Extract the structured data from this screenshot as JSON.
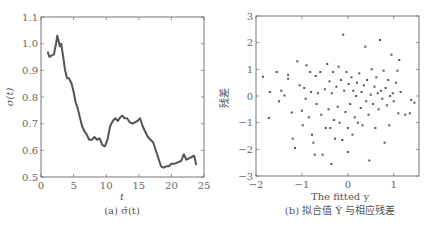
{
  "chart_data": [
    {
      "type": "line",
      "title": "",
      "caption": "(a) σ̂(t)",
      "xlabel": "t",
      "ylabel": "σ(t)",
      "xlim": [
        0,
        25
      ],
      "ylim": [
        0.5,
        1.1
      ],
      "xticks": [
        0,
        5,
        10,
        15,
        20,
        25
      ],
      "yticks": [
        0.5,
        0.6,
        0.7,
        0.8,
        0.9,
        1.0,
        1.1
      ],
      "xtick_labels": [
        "0",
        "5",
        "10",
        "15",
        "20",
        "25"
      ],
      "ytick_labels": [
        "0.5",
        "0.6",
        "0.7",
        "0.8",
        "0.9",
        "1.0",
        "1.1"
      ],
      "grid": false,
      "series": [
        {
          "name": "sigma_hat",
          "color": "#555555",
          "x": [
            1.0,
            1.3,
            1.6,
            2.0,
            2.3,
            2.5,
            2.7,
            2.9,
            3.1,
            3.4,
            3.7,
            4.0,
            4.3,
            4.7,
            5.0,
            5.3,
            5.6,
            6.0,
            6.3,
            6.7,
            7.0,
            7.4,
            7.8,
            8.2,
            8.6,
            9.0,
            9.4,
            9.8,
            10.2,
            10.6,
            11.0,
            11.4,
            11.8,
            12.2,
            12.5,
            12.8,
            13.2,
            13.6,
            14.0,
            14.4,
            14.8,
            15.2,
            15.6,
            16.0,
            16.4,
            16.8,
            17.2,
            17.6,
            18.0,
            18.4,
            18.8,
            19.2,
            19.6,
            20.0,
            20.5,
            21.0,
            21.5,
            21.9,
            22.3,
            22.7,
            23.1,
            23.5,
            23.8
          ],
          "y": [
            0.97,
            0.95,
            0.955,
            0.96,
            1.0,
            1.03,
            1.01,
            0.99,
            1.0,
            0.95,
            0.9,
            0.87,
            0.87,
            0.85,
            0.82,
            0.78,
            0.76,
            0.72,
            0.69,
            0.67,
            0.66,
            0.64,
            0.64,
            0.65,
            0.64,
            0.645,
            0.62,
            0.615,
            0.64,
            0.69,
            0.71,
            0.72,
            0.71,
            0.725,
            0.73,
            0.72,
            0.72,
            0.705,
            0.7,
            0.705,
            0.71,
            0.72,
            0.69,
            0.67,
            0.65,
            0.64,
            0.63,
            0.6,
            0.57,
            0.54,
            0.535,
            0.54,
            0.54,
            0.55,
            0.55,
            0.555,
            0.56,
            0.585,
            0.565,
            0.57,
            0.575,
            0.58,
            0.545
          ]
        }
      ]
    },
    {
      "type": "scatter",
      "title": "",
      "caption": "(b) 拟合值 Ŷ 与相应残差",
      "xlabel": "The fitted y",
      "ylabel": "残差",
      "xlim": [
        -2,
        1.55
      ],
      "ylim": [
        -3,
        3
      ],
      "xticks": [
        -2,
        -1,
        0,
        1
      ],
      "yticks": [
        -3,
        -2,
        -1,
        0,
        1,
        2,
        3
      ],
      "xtick_labels": [
        "−2",
        "−1",
        "0",
        "1"
      ],
      "ytick_labels": [
        "−3",
        "−2",
        "−1",
        "0",
        "1",
        "2",
        "3"
      ],
      "grid": false,
      "series": [
        {
          "name": "residuals",
          "color": "#555555",
          "points": [
            [
              -1.85,
              0.72
            ],
            [
              -1.7,
              0.15
            ],
            [
              -1.72,
              -0.82
            ],
            [
              -1.55,
              0.9
            ],
            [
              -1.45,
              0.2
            ],
            [
              -1.5,
              -0.2
            ],
            [
              -1.38,
              0.02
            ],
            [
              -1.3,
              0.8
            ],
            [
              -1.3,
              0.65
            ],
            [
              -1.22,
              -0.62
            ],
            [
              -1.2,
              -1.6
            ],
            [
              -1.15,
              -1.95
            ],
            [
              -1.1,
              1.3
            ],
            [
              -1.05,
              0.4
            ],
            [
              -1.0,
              -0.55
            ],
            [
              -0.98,
              -1.1
            ],
            [
              -0.95,
              0.3
            ],
            [
              -0.92,
              -0.1
            ],
            [
              -0.9,
              1.15
            ],
            [
              -0.85,
              -0.8
            ],
            [
              -0.82,
              0.9
            ],
            [
              -0.8,
              0.15
            ],
            [
              -0.78,
              -1.45
            ],
            [
              -0.75,
              -1.75
            ],
            [
              -0.72,
              -2.2
            ],
            [
              -0.7,
              0.75
            ],
            [
              -0.68,
              -0.3
            ],
            [
              -0.65,
              0.1
            ],
            [
              -0.6,
              0.9
            ],
            [
              -0.58,
              -0.7
            ],
            [
              -0.55,
              -2.2
            ],
            [
              -0.5,
              0.25
            ],
            [
              -0.48,
              -1.2
            ],
            [
              -0.45,
              1.2
            ],
            [
              -0.42,
              -0.5
            ],
            [
              -0.4,
              0.55
            ],
            [
              -0.38,
              -1.2
            ],
            [
              -0.36,
              -2.55
            ],
            [
              -0.35,
              0.1
            ],
            [
              -0.32,
              0.9
            ],
            [
              -0.3,
              -0.9
            ],
            [
              -0.28,
              -1.6
            ],
            [
              -0.25,
              0.35
            ],
            [
              -0.22,
              -0.4
            ],
            [
              -0.2,
              1.1
            ],
            [
              -0.18,
              -1.0
            ],
            [
              -0.15,
              0.6
            ],
            [
              -0.12,
              -1.65
            ],
            [
              -0.1,
              2.3
            ],
            [
              -0.08,
              0.2
            ],
            [
              -0.05,
              -0.6
            ],
            [
              -0.03,
              0.9
            ],
            [
              0.0,
              -1.2
            ],
            [
              0.0,
              -2.1
            ],
            [
              0.02,
              0.45
            ],
            [
              0.05,
              -0.3
            ],
            [
              0.08,
              0.7
            ],
            [
              0.1,
              -1.45
            ],
            [
              0.12,
              0.2
            ],
            [
              0.15,
              -0.8
            ],
            [
              0.18,
              0.0
            ],
            [
              0.2,
              0.5
            ],
            [
              0.22,
              -1.0
            ],
            [
              0.25,
              0.85
            ],
            [
              0.28,
              -0.45
            ],
            [
              0.3,
              0.15
            ],
            [
              0.32,
              -1.1
            ],
            [
              0.35,
              0.4
            ],
            [
              0.38,
              1.85
            ],
            [
              0.4,
              -0.2
            ],
            [
              0.42,
              0.6
            ],
            [
              0.45,
              -0.7
            ],
            [
              0.47,
              -2.42
            ],
            [
              0.5,
              0.05
            ],
            [
              0.52,
              1.0
            ],
            [
              0.55,
              -0.3
            ],
            [
              0.58,
              0.35
            ],
            [
              0.6,
              -1.2
            ],
            [
              0.62,
              0.7
            ],
            [
              0.65,
              0.1
            ],
            [
              0.67,
              -0.5
            ],
            [
              0.7,
              2.1
            ],
            [
              0.72,
              0.2
            ],
            [
              0.75,
              -0.1
            ],
            [
              0.78,
              0.95
            ],
            [
              0.8,
              -1.75
            ],
            [
              0.82,
              0.3
            ],
            [
              0.85,
              -0.35
            ],
            [
              0.88,
              0.6
            ],
            [
              0.9,
              -1.1
            ],
            [
              0.92,
              0.0
            ],
            [
              0.95,
              1.55
            ],
            [
              0.98,
              0.1
            ],
            [
              1.0,
              -0.2
            ],
            [
              1.05,
              0.5
            ],
            [
              1.08,
              0.95
            ],
            [
              1.1,
              -0.65
            ],
            [
              1.12,
              1.35
            ],
            [
              1.15,
              0.15
            ],
            [
              1.25,
              -0.7
            ],
            [
              1.35,
              -0.65
            ],
            [
              1.38,
              -0.15
            ],
            [
              1.45,
              -0.25
            ]
          ]
        }
      ]
    }
  ]
}
